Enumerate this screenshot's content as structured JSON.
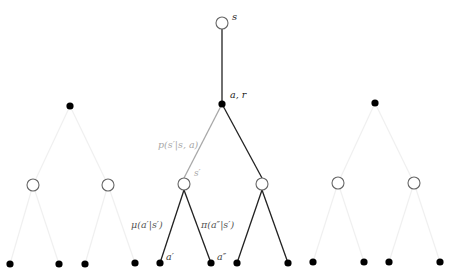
{
  "diagram": {
    "colors": {
      "edge": "#222222",
      "faint_edge": "#f0f0f0",
      "transition_edge": "#a8a8a8",
      "transition_label": "#a8a8a8",
      "policy_label": "#555555",
      "node_outline": "#666666",
      "node_fill_action": "#000000"
    },
    "labels": {
      "root_state": "s",
      "root_action": "a, r",
      "transition": "p(s′|s, a)",
      "next_state": "s′",
      "behavior_policy": "μ(a′|s′)",
      "target_policy": "π(a″|s′)",
      "action_a1": "a′",
      "action_a2": "a″"
    },
    "nodes": {
      "root": {
        "type": "state",
        "x": 222,
        "y": 23
      },
      "actions": [
        {
          "id": "left-action",
          "x": 70,
          "y": 106,
          "faded": true
        },
        {
          "id": "center-action",
          "x": 222,
          "y": 104,
          "faded": false
        },
        {
          "id": "right-action",
          "x": 375,
          "y": 103,
          "faded": true
        }
      ],
      "states": [
        {
          "id": "ls1",
          "x": 33,
          "y": 185,
          "faded": true
        },
        {
          "id": "ls2",
          "x": 108,
          "y": 185,
          "faded": true
        },
        {
          "id": "cs1",
          "x": 184,
          "y": 184,
          "faded": false
        },
        {
          "id": "cs2",
          "x": 262,
          "y": 184,
          "faded": false
        },
        {
          "id": "rs1",
          "x": 338,
          "y": 183,
          "faded": true
        },
        {
          "id": "rs2",
          "x": 414,
          "y": 183,
          "faded": true
        }
      ],
      "leaves": [
        {
          "x": 10,
          "y": 264
        },
        {
          "x": 59,
          "y": 264
        },
        {
          "x": 85,
          "y": 264
        },
        {
          "x": 135,
          "y": 263
        },
        {
          "x": 160,
          "y": 263
        },
        {
          "x": 211,
          "y": 263
        },
        {
          "x": 237,
          "y": 263
        },
        {
          "x": 288,
          "y": 263
        },
        {
          "x": 313,
          "y": 262
        },
        {
          "x": 364,
          "y": 262
        },
        {
          "x": 389,
          "y": 262
        },
        {
          "x": 440,
          "y": 262
        }
      ]
    }
  }
}
